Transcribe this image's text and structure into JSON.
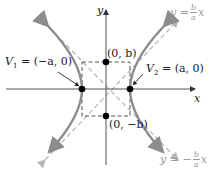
{
  "figure": {
    "axes": {
      "x_label": "x",
      "y_label": "y"
    },
    "labels": {
      "v1": "V₁ = (−a, 0)",
      "v1_name": "V",
      "v1_sub": "1",
      "v1_coord": " = (−a, 0)",
      "v2_name": "V",
      "v2_sub": "2",
      "v2_coord": " = (a, 0)",
      "b_pos": "(0, b)",
      "b_neg": "(0, −b)"
    },
    "asymptotes": {
      "positive": {
        "lhs": "y = ",
        "num": "b",
        "den": "a",
        "var": "x"
      },
      "negative": {
        "lhs": "y = −",
        "num": "b",
        "den": "a",
        "var": "x"
      }
    },
    "colors": {
      "axis": "#555555",
      "curve": "#8c8c8c",
      "asymptote": "#b0b0b0",
      "box": "#444444",
      "point": "#000000",
      "label_gray": "#9a9a9a"
    }
  }
}
